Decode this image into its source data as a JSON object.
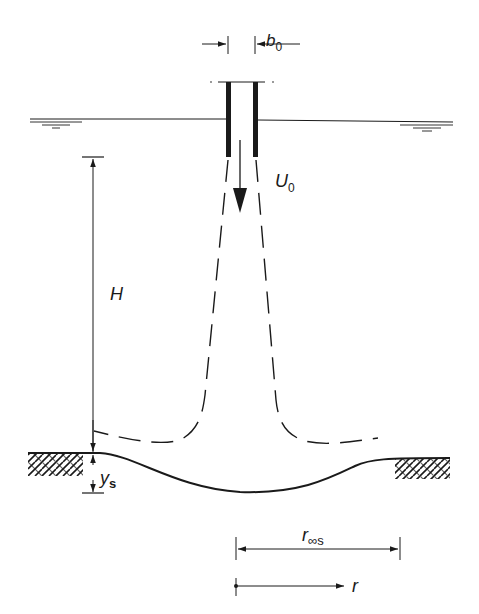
{
  "diagram": {
    "type": "schematic",
    "colors": {
      "ink": "#1a1a1a",
      "background": "#ffffff"
    },
    "labels": {
      "nozzle_width": {
        "main": "b",
        "sub": "0"
      },
      "jet_velocity": {
        "main": "U",
        "sub": "0"
      },
      "height": {
        "main": "H"
      },
      "scour_depth": {
        "main": "y",
        "sub": "s"
      },
      "scour_radius": {
        "main": "r",
        "sub": "∞s"
      },
      "radial_coord": {
        "main": "r"
      }
    },
    "elements": [
      "nozzle",
      "water-surface",
      "jet-velocity-arrow",
      "jet-boundary-dashed",
      "wall-jet-dashed",
      "original-bed-hatched",
      "scour-profile",
      "dimension-H",
      "dimension-ys",
      "dimension-b0",
      "dimension-r-inf-s",
      "axis-r"
    ]
  }
}
